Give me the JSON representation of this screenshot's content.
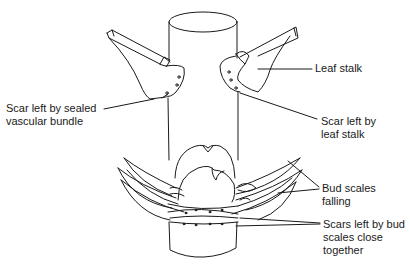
{
  "diagram": {
    "line_color": "#1a1a1a",
    "background": "#ffffff",
    "labels": [
      {
        "id": "scar-sealed-vascular-bundle",
        "lines": [
          "Scar left by sealed",
          "vascular bundle"
        ]
      },
      {
        "id": "leaf-stalk",
        "lines": [
          "Leaf stalk"
        ]
      },
      {
        "id": "scar-leaf-stalk",
        "lines": [
          "Scar left by",
          "leaf stalk"
        ]
      },
      {
        "id": "bud-scales-falling",
        "lines": [
          "Bud scales",
          "falling"
        ]
      },
      {
        "id": "scars-bud-scales",
        "lines": [
          "Scars left by bud",
          "scales close",
          "together"
        ]
      }
    ]
  }
}
